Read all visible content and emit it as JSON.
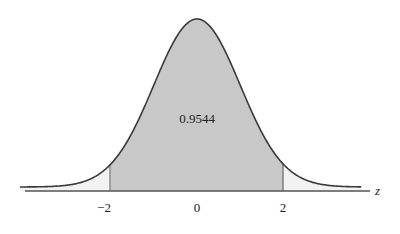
{
  "chart_data": {
    "type": "area",
    "title": "",
    "xlabel": "z",
    "ylabel": "",
    "distribution": "standard normal",
    "xlim": [
      -4.1,
      3.8
    ],
    "x_ticks": [
      -2,
      0,
      2
    ],
    "x_tick_labels": [
      "−2",
      "0",
      "2"
    ],
    "shaded_region": {
      "from": -2,
      "to": 2,
      "area": 0.9544
    },
    "annotation": "0.9544",
    "grid": false,
    "legend": null,
    "colors": {
      "shaded": "#c8c8c8",
      "tails": "#f2f2f2",
      "curve": "#3a3a3a",
      "axis": "#555555"
    }
  }
}
